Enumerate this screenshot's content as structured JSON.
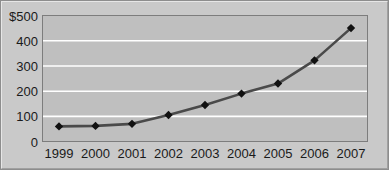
{
  "chart_data": {
    "type": "line",
    "title": "",
    "subtitle": "",
    "xlabel": "",
    "ylabel": "",
    "categories": [
      "1999",
      "2000",
      "2001",
      "2002",
      "2003",
      "2004",
      "2005",
      "2006",
      "2007"
    ],
    "values": [
      60,
      62,
      70,
      105,
      145,
      190,
      230,
      322,
      450
    ],
    "series": [
      {
        "name": "",
        "values": [
          60,
          62,
          70,
          105,
          145,
          190,
          230,
          322,
          450
        ]
      }
    ],
    "ylim": [
      0,
      500
    ],
    "y_ticks": [
      0,
      100,
      200,
      300,
      400,
      500
    ],
    "y_tick_labels": [
      "0",
      "100",
      "200",
      "300",
      "400",
      "$500"
    ],
    "x_tick_labels": [
      "1999",
      "2000",
      "2001",
      "2002",
      "2003",
      "2004",
      "2005",
      "2006",
      "2007"
    ],
    "grid": true,
    "grid_axis": "y",
    "grid_color": "#ffffff",
    "legend": false,
    "legend_position": "none",
    "line_color": "#4a4a4a",
    "marker_color": "#111111",
    "marker_shape": "diamond",
    "plot_background": "#bfbfbf",
    "figure_background": "#c9c9c9",
    "annotations": []
  },
  "figure": {
    "name": "line-chart",
    "currency_prefix": "$"
  }
}
